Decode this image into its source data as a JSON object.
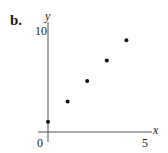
{
  "panel_label": "b.",
  "chart_data": {
    "type": "scatter",
    "title": "",
    "xlabel": "x",
    "ylabel": "y",
    "x": [
      0,
      1,
      2,
      3,
      4
    ],
    "y": [
      1,
      3,
      5,
      7,
      9
    ],
    "xlim": [
      0,
      5
    ],
    "ylim": [
      0,
      10
    ],
    "xticks": [
      "0",
      "5"
    ],
    "yticks": [
      "10"
    ],
    "grid": false,
    "legend": null
  },
  "style": {
    "point_color": "#111111",
    "axis_color": "#555555"
  }
}
